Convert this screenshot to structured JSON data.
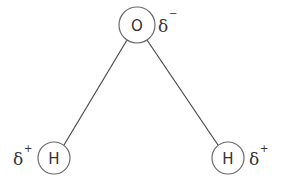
{
  "diagram": {
    "atoms": [
      {
        "id": "oxygen",
        "symbol": "O",
        "charge_symbol": "δ",
        "charge_sign": "−",
        "cx": 137,
        "cy": 25,
        "r": 18
      },
      {
        "id": "hydrogen-left",
        "symbol": "H",
        "charge_symbol": "δ",
        "charge_sign": "+",
        "cx": 54,
        "cy": 158,
        "r": 16
      },
      {
        "id": "hydrogen-right",
        "symbol": "H",
        "charge_symbol": "δ",
        "charge_sign": "+",
        "cx": 228,
        "cy": 158,
        "r": 16
      }
    ],
    "bonds": [
      {
        "from": "oxygen",
        "to": "hydrogen-left"
      },
      {
        "from": "oxygen",
        "to": "hydrogen-right"
      }
    ],
    "colors": {
      "stroke": "#6a6a6a",
      "text": "#333333",
      "background": "#ffffff"
    }
  }
}
